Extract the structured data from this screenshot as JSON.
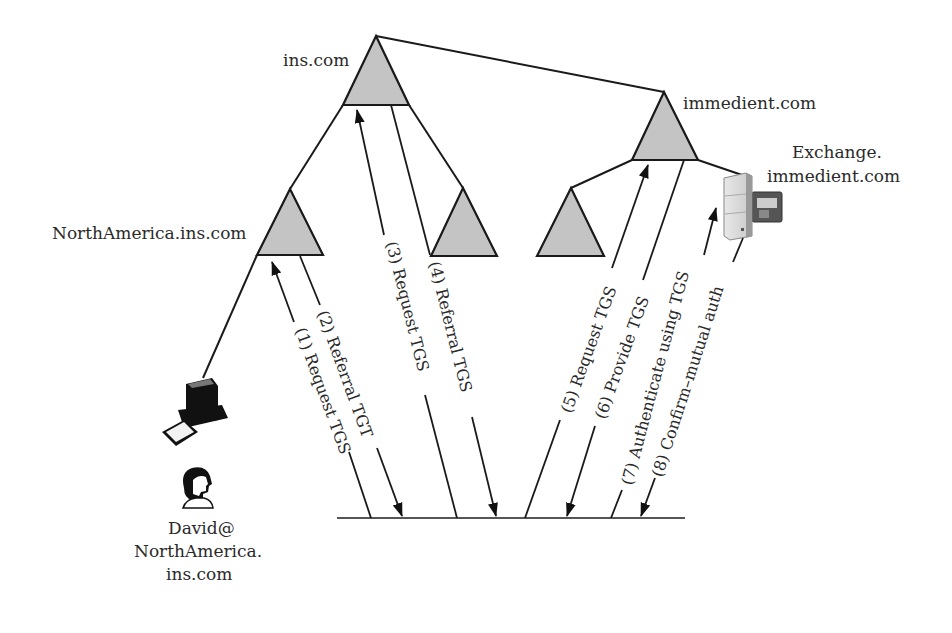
{
  "diagram": {
    "realms": {
      "root": {
        "label": "ins.com"
      },
      "north_america": {
        "label": "NorthAmerica.ins.com"
      },
      "immedient": {
        "label": "immedient.com"
      },
      "ins_child_unlabeled": {
        "label": ""
      },
      "immedient_child_unlabeled": {
        "label": ""
      }
    },
    "server": {
      "label_line1": "Exchange.",
      "label_line2": "immedient.com",
      "icon": "server-icon"
    },
    "client": {
      "computer_icon": "computer-icon",
      "user_icon": "user-icon",
      "label_line1": "David@",
      "label_line2": "NorthAmerica.",
      "label_line3": "ins.com"
    },
    "flows": [
      {
        "step": 1,
        "label": "(1) Request TGS",
        "direction": "to NorthAmerica.ins.com"
      },
      {
        "step": 2,
        "label": "(2) Referral TGT",
        "direction": "from NorthAmerica.ins.com"
      },
      {
        "step": 3,
        "label": "(3) Request TGS",
        "direction": "to ins.com"
      },
      {
        "step": 4,
        "label": "(4) Referral TGS",
        "direction": "from ins.com"
      },
      {
        "step": 5,
        "label": "(5) Request TGS",
        "direction": "to immedient.com"
      },
      {
        "step": 6,
        "label": "(6) Provide TGS",
        "direction": "from immedient.com"
      },
      {
        "step": 7,
        "label": "(7) Authenticate using TGS",
        "direction": "to Exchange.immedient.com"
      },
      {
        "step": 8,
        "label": "(8) Confirm–mutual auth",
        "direction": "from Exchange.immedient.com"
      }
    ],
    "colors": {
      "triangle_fill": "#c4c4c4",
      "stroke": "#1a1a1a",
      "text": "#2a2a2a"
    }
  }
}
